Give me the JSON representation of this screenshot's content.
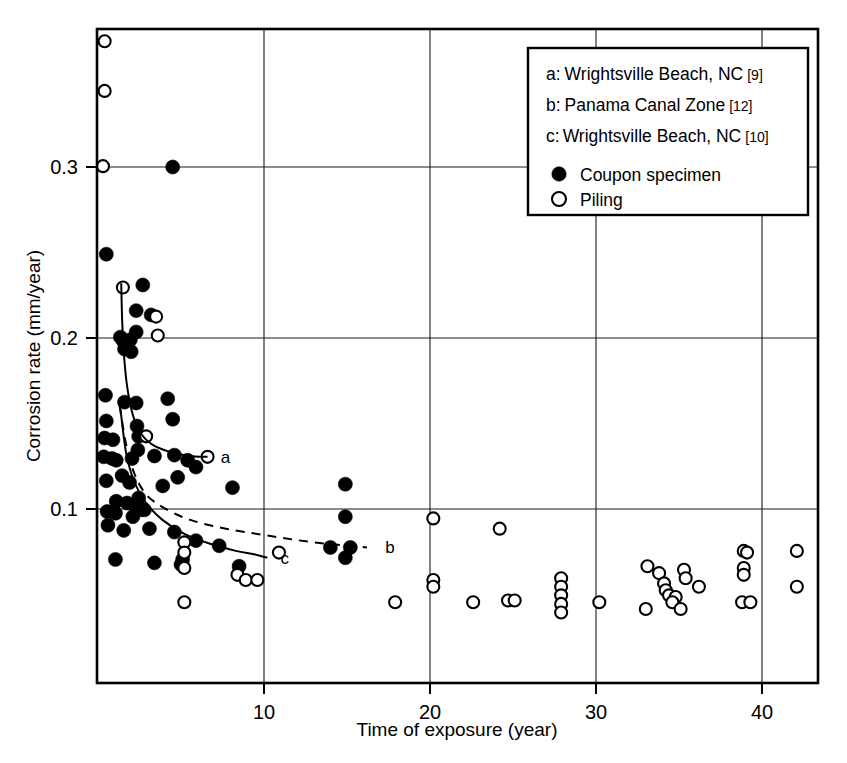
{
  "chart_data": {
    "type": "scatter",
    "title": "",
    "xlabel": "Time of exposure (year)",
    "ylabel": "Corrosion rate (mm/year)",
    "xlim": [
      0,
      43.5
    ],
    "ylim": [
      0,
      0.4
    ],
    "xticks": [
      10,
      20,
      30,
      40
    ],
    "yticks": [
      0.1,
      0.2,
      0.3
    ],
    "xtick_labels": [
      "10",
      "20",
      "30",
      "40"
    ],
    "ytick_labels": [
      "0.1",
      "0.2",
      "0.3"
    ],
    "grid": true,
    "legend_position": "top-right",
    "series": [
      {
        "name": "Coupon specimen",
        "marker": "filled-circle",
        "color": "#000000",
        "points": [
          [
            4.5,
            0.3
          ],
          [
            0.5,
            0.249
          ],
          [
            2.7,
            0.231
          ],
          [
            2.3,
            0.216
          ],
          [
            3.2,
            0.2135
          ],
          [
            2.3,
            0.2035
          ],
          [
            1.35,
            0.2005
          ],
          [
            1.5,
            0.1985
          ],
          [
            1.75,
            0.1975
          ],
          [
            1.95,
            0.199
          ],
          [
            1.6,
            0.1935
          ],
          [
            2.0,
            0.192
          ],
          [
            0.45,
            0.1665
          ],
          [
            1.6,
            0.1625
          ],
          [
            2.3,
            0.162
          ],
          [
            4.2,
            0.1645
          ],
          [
            0.5,
            0.1515
          ],
          [
            4.5,
            0.1525
          ],
          [
            2.35,
            0.1485
          ],
          [
            2.45,
            0.1425
          ],
          [
            0.4,
            0.1415
          ],
          [
            0.9,
            0.1405
          ],
          [
            2.4,
            0.1345
          ],
          [
            0.35,
            0.1305
          ],
          [
            0.85,
            0.1295
          ],
          [
            1.1,
            0.1285
          ],
          [
            2.05,
            0.1295
          ],
          [
            3.4,
            0.131
          ],
          [
            4.6,
            0.1315
          ],
          [
            5.4,
            0.1285
          ],
          [
            5.9,
            0.1245
          ],
          [
            4.8,
            0.1185
          ],
          [
            1.45,
            0.1195
          ],
          [
            0.5,
            0.1165
          ],
          [
            1.9,
            0.1155
          ],
          [
            3.9,
            0.1135
          ],
          [
            2.45,
            0.1065
          ],
          [
            1.1,
            0.1045
          ],
          [
            1.75,
            0.1035
          ],
          [
            2.25,
            0.1015
          ],
          [
            2.45,
            0.1005
          ],
          [
            2.6,
            0.0995
          ],
          [
            2.8,
            0.0995
          ],
          [
            0.55,
            0.0985
          ],
          [
            1.05,
            0.0975
          ],
          [
            2.1,
            0.0955
          ],
          [
            8.1,
            0.1125
          ],
          [
            14.9,
            0.1145
          ],
          [
            0.6,
            0.0905
          ],
          [
            1.55,
            0.0875
          ],
          [
            3.1,
            0.0885
          ],
          [
            4.6,
            0.0865
          ],
          [
            14.9,
            0.0955
          ],
          [
            5.9,
            0.0815
          ],
          [
            7.3,
            0.0785
          ],
          [
            14.0,
            0.0775
          ],
          [
            15.2,
            0.0775
          ],
          [
            14.9,
            0.0715
          ],
          [
            1.05,
            0.0705
          ],
          [
            3.4,
            0.0685
          ],
          [
            5.0,
            0.0675
          ],
          [
            5.1,
            0.0705
          ],
          [
            8.5,
            0.0665
          ]
        ]
      },
      {
        "name": "Piling",
        "marker": "open-circle",
        "color": "#000000",
        "points": [
          [
            0.4,
            0.3735
          ],
          [
            0.4,
            0.3445
          ],
          [
            0.3,
            0.3005
          ],
          [
            1.5,
            0.2295
          ],
          [
            3.5,
            0.2125
          ],
          [
            3.6,
            0.2015
          ],
          [
            2.9,
            0.1425
          ],
          [
            6.6,
            0.1305
          ],
          [
            20.2,
            0.0945
          ],
          [
            24.2,
            0.0885
          ],
          [
            5.2,
            0.0805
          ],
          [
            5.2,
            0.0745
          ],
          [
            10.9,
            0.0745
          ],
          [
            5.2,
            0.0655
          ],
          [
            8.4,
            0.0615
          ],
          [
            8.9,
            0.0585
          ],
          [
            9.6,
            0.0585
          ],
          [
            20.2,
            0.0585
          ],
          [
            20.2,
            0.0545
          ],
          [
            5.2,
            0.0455
          ],
          [
            17.9,
            0.0455
          ],
          [
            22.6,
            0.0455
          ],
          [
            24.7,
            0.0465
          ],
          [
            25.1,
            0.0465
          ],
          [
            27.9,
            0.0595
          ],
          [
            27.9,
            0.0545
          ],
          [
            27.9,
            0.0495
          ],
          [
            27.9,
            0.0445
          ],
          [
            27.9,
            0.0395
          ],
          [
            30.2,
            0.0455
          ],
          [
            33.1,
            0.0665
          ],
          [
            33.8,
            0.0625
          ],
          [
            34.1,
            0.0565
          ],
          [
            34.2,
            0.0525
          ],
          [
            34.4,
            0.0495
          ],
          [
            34.8,
            0.0485
          ],
          [
            34.6,
            0.0455
          ],
          [
            33.0,
            0.0415
          ],
          [
            35.3,
            0.0645
          ],
          [
            35.4,
            0.0595
          ],
          [
            36.2,
            0.0545
          ],
          [
            35.1,
            0.0415
          ],
          [
            38.9,
            0.0755
          ],
          [
            39.1,
            0.0745
          ],
          [
            38.9,
            0.0655
          ],
          [
            38.9,
            0.0615
          ],
          [
            38.8,
            0.0455
          ],
          [
            39.3,
            0.0455
          ],
          [
            42.1,
            0.0755
          ],
          [
            42.1,
            0.0545
          ]
        ]
      }
    ],
    "curves": [
      {
        "id": "a",
        "label": "a",
        "style": "solid",
        "description": "Wrightsville Beach, NC [9]",
        "path": [
          [
            1.4,
            0.232
          ],
          [
            1.45,
            0.212
          ],
          [
            1.55,
            0.192
          ],
          [
            1.75,
            0.172
          ],
          [
            2.1,
            0.155
          ],
          [
            2.6,
            0.144
          ],
          [
            3.3,
            0.1375
          ],
          [
            4.3,
            0.1335
          ],
          [
            5.5,
            0.131
          ],
          [
            6.6,
            0.1305
          ]
        ]
      },
      {
        "id": "b",
        "label": "b",
        "style": "dashed",
        "description": "Panama Canal Zone [12]",
        "path": [
          [
            1.3,
            0.1605
          ],
          [
            1.7,
            0.1375
          ],
          [
            2.2,
            0.1205
          ],
          [
            2.9,
            0.1085
          ],
          [
            4.0,
            0.1005
          ],
          [
            5.6,
            0.0935
          ],
          [
            7.7,
            0.0885
          ],
          [
            10.2,
            0.0845
          ],
          [
            13.0,
            0.0805
          ],
          [
            16.2,
            0.0775
          ]
        ]
      },
      {
        "id": "c",
        "label": "c",
        "style": "solid",
        "description": "Wrightsville Beach, NC [10]",
        "path": [
          [
            1.35,
            0.1585
          ],
          [
            1.7,
            0.1325
          ],
          [
            2.2,
            0.1155
          ],
          [
            2.9,
            0.1035
          ],
          [
            3.9,
            0.0935
          ],
          [
            5.2,
            0.0855
          ],
          [
            6.8,
            0.0795
          ],
          [
            8.3,
            0.0755
          ],
          [
            9.4,
            0.0735
          ],
          [
            10.2,
            0.0715
          ]
        ]
      }
    ],
    "curve_labels": [
      {
        "id": "a",
        "text": "a",
        "x": 7.1,
        "y": 0.1305
      },
      {
        "id": "b",
        "text": "b",
        "x": 17.0,
        "y": 0.0775
      },
      {
        "id": "c",
        "text": "c",
        "x": 10.7,
        "y": 0.0715
      }
    ]
  },
  "legend": {
    "references": [
      {
        "key": "a:",
        "text": "Wrightsville Beach, NC",
        "ref": "[9]"
      },
      {
        "key": "b:",
        "text": "Panama Canal Zone",
        "ref": "[12]"
      },
      {
        "key": "c:",
        "text": "Wrightsville Beach, NC",
        "ref": "[10]"
      }
    ],
    "markers": [
      {
        "symbol": "filled-circle",
        "label": "Coupon specimen"
      },
      {
        "symbol": "open-circle",
        "label": "Piling"
      }
    ]
  },
  "axes": {
    "x_title": "Time of exposure (year)",
    "y_title": "Corrosion rate (mm/year)",
    "x_ticks": [
      "10",
      "20",
      "30",
      "40"
    ],
    "y_ticks": [
      "0.1",
      "0.2",
      "0.3"
    ]
  },
  "colors": {
    "ink": "#000000",
    "paper": "#ffffff",
    "grid": "#1a1a1a"
  }
}
